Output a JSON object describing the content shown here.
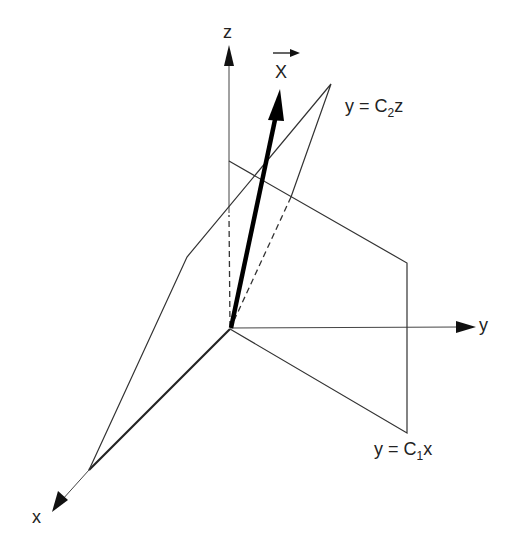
{
  "diagram": {
    "axes": {
      "x_label": "x",
      "y_label": "y",
      "z_label": "z"
    },
    "vector": {
      "label": "X",
      "has_arrow_accent": true
    },
    "planes": [
      {
        "name": "plane-c2z",
        "equation_prefix": "y = C",
        "subscript": "2",
        "suffix": "z"
      },
      {
        "name": "plane-c1x",
        "equation_prefix": "y = C",
        "subscript": "1",
        "suffix": "x"
      }
    ],
    "geometry": {
      "origin": [
        230,
        329
      ],
      "z_axis_tip": [
        229,
        45
      ],
      "y_axis_tip": [
        476,
        327
      ],
      "x_axis_tip": [
        52,
        512
      ],
      "vector_tip": [
        280,
        90
      ],
      "plane_c2z": [
        [
          230,
          329
        ],
        [
          89,
          470
        ],
        [
          187,
          257
        ],
        [
          331,
          84
        ]
      ],
      "plane_c1x": [
        [
          230,
          329
        ],
        [
          229,
          161
        ],
        [
          407,
          263
        ],
        [
          407,
          433
        ]
      ]
    },
    "colors": {
      "line": "#333333",
      "vector": "#000000",
      "background": "#ffffff"
    }
  }
}
